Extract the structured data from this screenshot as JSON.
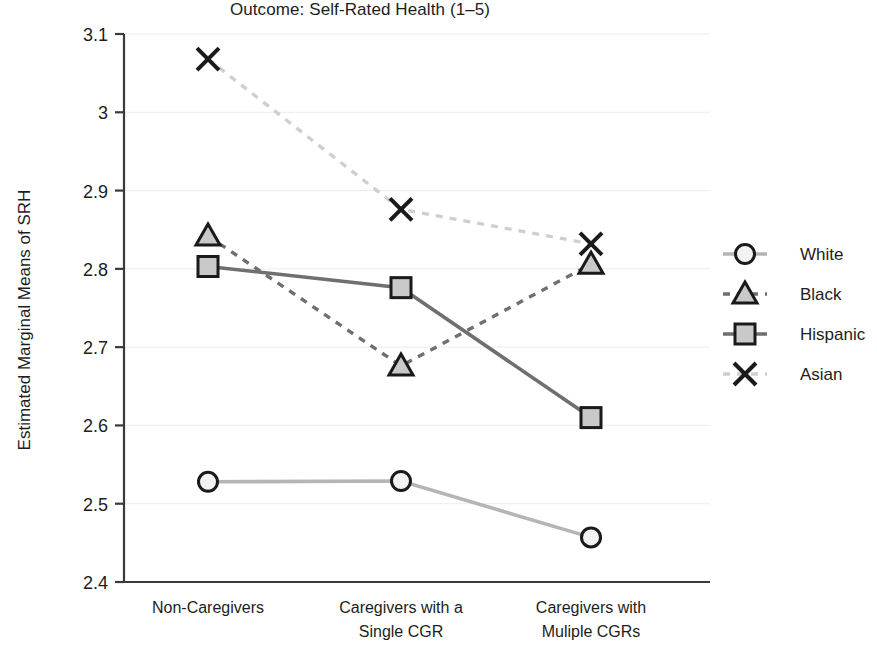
{
  "chart_data": {
    "type": "line",
    "title": "Outcome: Self-Rated Health (1–5)",
    "xlabel": "",
    "ylabel": "Estimated Marginal Means of SRH",
    "categories": [
      "Non-Caregivers",
      "Caregivers with a Single CGR",
      "Caregivers with Muliple CGRs"
    ],
    "category_lines": [
      [
        "Non-Caregivers"
      ],
      [
        "Caregivers with a",
        "Single CGR"
      ],
      [
        "Caregivers with",
        "Muliple CGRs"
      ]
    ],
    "ylim": [
      2.4,
      3.1
    ],
    "yticks": [
      2.4,
      2.5,
      2.6,
      2.7,
      2.8,
      2.9,
      3.0,
      3.1
    ],
    "ytick_labels": [
      "2.4",
      "2.5",
      "2.6",
      "2.7",
      "2.8",
      "2.9",
      "3",
      "3.1"
    ],
    "grid": true,
    "legend_position": "right",
    "series": [
      {
        "name": "White",
        "values": [
          2.528,
          2.529,
          2.457
        ],
        "marker": "circle",
        "line_style": "solid",
        "color": "#b5b5b5",
        "marker_edge": "#1a1a1a",
        "marker_fill": "#f2f2f2"
      },
      {
        "name": "Black",
        "values": [
          2.842,
          2.676,
          2.806
        ],
        "marker": "triangle",
        "line_style": "dashed",
        "color": "#6f6f6f",
        "marker_edge": "#1a1a1a",
        "marker_fill": "#c9c9c9"
      },
      {
        "name": "Hispanic",
        "values": [
          2.803,
          2.776,
          2.61
        ],
        "marker": "square",
        "line_style": "solid",
        "color": "#6f6f6f",
        "marker_edge": "#1a1a1a",
        "marker_fill": "#c9c9c9"
      },
      {
        "name": "Asian",
        "values": [
          3.068,
          2.876,
          2.832
        ],
        "marker": "x",
        "line_style": "dashed",
        "color": "#cfcfcf",
        "marker_edge": "#1a1a1a",
        "marker_fill": "none"
      }
    ]
  },
  "axes": {
    "y_axis_title": "Estimated Marginal Means of SRH"
  },
  "legend": {
    "entries": [
      "White",
      "Black",
      "Hispanic",
      "Asian"
    ]
  }
}
